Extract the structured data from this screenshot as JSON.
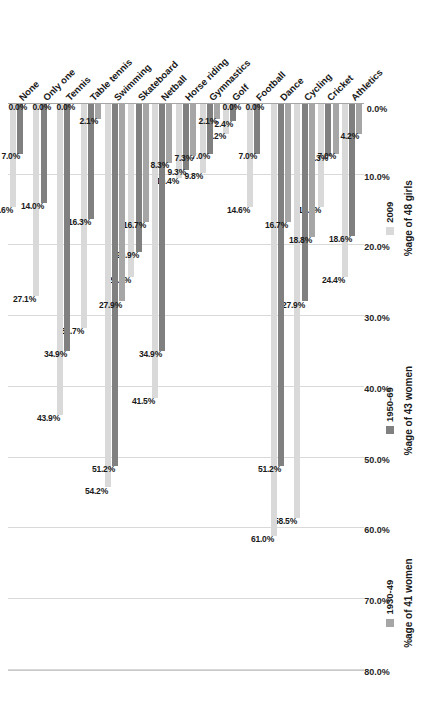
{
  "chart_data": {
    "type": "bar",
    "orientation": "horizontal",
    "title": "",
    "subtitle": "",
    "xlabel": "",
    "ylabel": "",
    "xlim": [
      0,
      80
    ],
    "grid": true,
    "legend_position": "right",
    "axis_direction": "reversed",
    "tick_labels": [
      "80.0%",
      "70.0%",
      "60.0%",
      "50.0%",
      "40.0%",
      "30.0%",
      "20.0%",
      "10.0%",
      "0.0%"
    ],
    "tick_values": [
      80,
      70,
      60,
      50,
      40,
      30,
      20,
      10,
      0
    ],
    "categories": [
      "Athletics",
      "Cricket",
      "Cycling",
      "Dance",
      "Football",
      "Golf",
      "Gymnastics",
      "Horse riding",
      "Netball",
      "Skateboard",
      "Swimming",
      "Table tennis",
      "Tennis",
      "Only one",
      "None"
    ],
    "series": [
      {
        "name": "2009",
        "sublabel": "%age of 48 girls",
        "color": "#d9d9d9",
        "values": [
          24.4,
          14.6,
          58.5,
          61.0,
          14.6,
          4.2,
          9.8,
          10.4,
          41.5,
          24.4,
          54.2,
          31.7,
          43.9,
          27.1,
          14.6
        ],
        "labels": [
          "24.4%",
          "14.6%",
          "58.5%",
          "61.0%",
          "14.6%",
          "4.2%",
          "9.8%",
          "10.4%",
          "41.5%",
          "24.4%",
          "54.2%",
          "31.7%",
          "43.9%",
          "27.1%",
          "14.6%"
        ]
      },
      {
        "name": "1950-69",
        "sublabel": "%age of 43 women",
        "color": "#808080",
        "values": [
          18.6,
          7.3,
          27.9,
          51.2,
          7.0,
          2.4,
          7.0,
          9.3,
          34.9,
          20.9,
          51.2,
          16.3,
          34.9,
          14.0,
          7.0
        ],
        "labels": [
          "18.6%",
          "7.3%",
          "27.9%",
          "51.2%",
          "7.0%",
          "2.4%",
          "7.0%",
          "9.3%",
          "34.9%",
          "20.9%",
          "51.2%",
          "16.3%",
          "34.9%",
          "14.0%",
          "7.0%"
        ]
      },
      {
        "name": "1930-49",
        "sublabel": "%age of 41 women",
        "color": "#a6a6a6",
        "values": [
          4.2,
          7.0,
          18.8,
          16.7,
          0.0,
          0.0,
          2.1,
          7.3,
          8.3,
          16.7,
          27.9,
          2.1,
          0.0,
          0.0,
          0.0
        ],
        "labels": [
          "4.2%",
          "7.0%",
          "18.8%",
          "16.7%",
          "0.0%",
          "0.0%",
          "2.1%",
          "7.3%",
          "8.3%",
          "16.7%",
          "27.9%",
          "2.1%",
          "0.0%",
          "0.0%",
          "0.0%"
        ]
      }
    ],
    "extra_labels": [
      "0.0%"
    ]
  }
}
